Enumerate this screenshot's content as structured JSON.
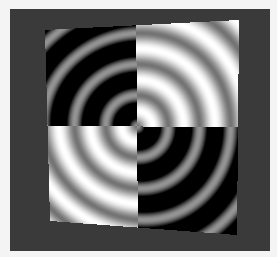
{
  "canvas": {
    "width": 277,
    "height": 257,
    "background": "#f4f4f4"
  },
  "frame": {
    "x": 10,
    "y": 9,
    "width": 260,
    "height": 242,
    "color": "#3a3a3a"
  },
  "figure": {
    "corners": {
      "top_left": [
        45,
        30
      ],
      "top_right": [
        239,
        20
      ],
      "bottom_right": [
        237,
        235
      ],
      "bottom_left": [
        50,
        221
      ]
    },
    "center": [
      136,
      129
    ],
    "ring_period_px": 31.5,
    "quadrants": {
      "top_left": {
        "style": "dark",
        "low": 0.0,
        "high": 0.58
      },
      "top_right": {
        "style": "bright",
        "low": 0.45,
        "high": 1.0
      },
      "bottom_left": {
        "style": "bright",
        "low": 0.45,
        "high": 1.0
      },
      "bottom_right": {
        "style": "dark",
        "low": 0.0,
        "high": 0.58
      }
    }
  }
}
